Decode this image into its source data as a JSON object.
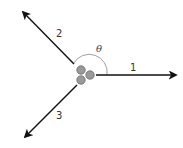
{
  "diagram": {
    "title": "",
    "colors": {
      "arrow": "#111111",
      "atom_fill": "#9a9a9a",
      "atom_stroke": "#6a6a6a",
      "arc": "#888888",
      "label": "#333333"
    },
    "atoms": [
      {
        "id": "atom-top",
        "cx": 81,
        "cy": 70,
        "r": 4.2
      },
      {
        "id": "atom-right",
        "cx": 90,
        "cy": 75,
        "r": 4.2
      },
      {
        "id": "atom-bottom",
        "cx": 81,
        "cy": 80,
        "r": 4.2
      }
    ],
    "arrows": [
      {
        "label": "1",
        "x1": 96,
        "y1": 75,
        "x2": 176,
        "y2": 75,
        "label_x": 130,
        "label_y": 71
      },
      {
        "label": "2",
        "x1": 74,
        "y1": 64,
        "x2": 23,
        "y2": 12,
        "label_x": 56,
        "label_y": 37
      },
      {
        "label": "3",
        "x1": 77,
        "y1": 85,
        "x2": 25,
        "y2": 137,
        "label_x": 56,
        "label_y": 119
      }
    ],
    "angle": {
      "symbol": "θ",
      "label_x": 96,
      "label_y": 52,
      "description": "angle between arrow 1 and arrow 2"
    }
  }
}
